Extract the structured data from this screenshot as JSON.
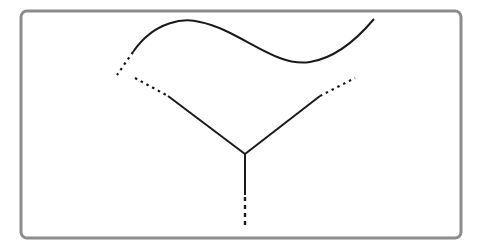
{
  "diagram": {
    "frame": {
      "x": 21,
      "y": 11,
      "width": 440,
      "height": 227,
      "rx": 6,
      "stroke": "#8c8c8c",
      "stroke_width": 3
    },
    "line_color": "#1a1a1a",
    "curve": {
      "path": "M133,52 C155,20 185,18 200,22 C240,30 275,68 310,62 C335,58 358,38 374,19"
    },
    "curve_dotted_extension": {
      "x1": 133,
      "y1": 52,
      "x2": 117,
      "y2": 75
    },
    "left_branch": {
      "dotted": {
        "x1": 135,
        "y1": 78,
        "x2": 168,
        "y2": 96
      },
      "solid": {
        "x1": 168,
        "y1": 96,
        "x2": 245,
        "y2": 154
      }
    },
    "right_branch": {
      "solid": {
        "x1": 245,
        "y1": 154,
        "x2": 320,
        "y2": 96
      },
      "dotted": {
        "x1": 320,
        "y1": 96,
        "x2": 355,
        "y2": 78
      }
    },
    "stem": {
      "solid": {
        "x1": 245,
        "y1": 154,
        "x2": 245,
        "y2": 195
      },
      "dotted": {
        "x1": 245,
        "y1": 197,
        "x2": 245,
        "y2": 228
      }
    }
  }
}
